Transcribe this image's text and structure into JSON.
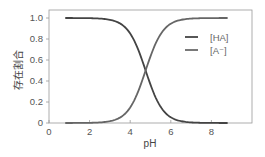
{
  "chart_data": {
    "type": "line",
    "title": "",
    "xlabel": "pH",
    "ylabel": "存在割合",
    "xlim": [
      0,
      10
    ],
    "ylim": [
      0,
      1.05
    ],
    "xticks": [
      0,
      2,
      4,
      6,
      8
    ],
    "xtick_labels": [
      "0",
      "2",
      "4",
      "6",
      "8"
    ],
    "yticks": [
      0,
      0.2,
      0.4,
      0.6,
      0.8,
      1.0
    ],
    "ytick_labels": [
      "0",
      "0.2",
      "0.4",
      "0.6",
      "0.8",
      "1.0"
    ],
    "grid": false,
    "legend_position": "upper right",
    "pKa": 4.76,
    "x": [
      0.8,
      1.5,
      2.0,
      2.5,
      3.0,
      3.5,
      4.0,
      4.25,
      4.5,
      4.76,
      5.0,
      5.25,
      5.5,
      6.0,
      6.5,
      7.0,
      7.5,
      8.0,
      8.8
    ],
    "series": [
      {
        "name": "[HA]",
        "color": "#444444",
        "values": [
          1.0,
          1.0,
          1.0,
          0.99,
          0.98,
          0.95,
          0.85,
          0.76,
          0.65,
          0.5,
          0.37,
          0.24,
          0.15,
          0.05,
          0.02,
          0.01,
          0.0,
          0.0,
          0.0
        ]
      },
      {
        "name": "[A⁻]",
        "color": "#666666",
        "values": [
          0.0,
          0.0,
          0.0,
          0.01,
          0.02,
          0.05,
          0.15,
          0.24,
          0.35,
          0.5,
          0.63,
          0.76,
          0.85,
          0.95,
          0.98,
          0.99,
          1.0,
          1.0,
          1.0
        ]
      }
    ]
  },
  "legend": {
    "items": [
      {
        "label": "[HA]",
        "color": "#444444"
      },
      {
        "label": "[A⁻]",
        "color": "#666666"
      }
    ]
  }
}
